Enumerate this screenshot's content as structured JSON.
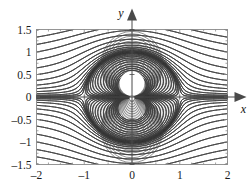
{
  "figure": {
    "kind": "contour-plot",
    "background_color": "#ffffff",
    "frame_color": "#8a8a8a",
    "contour_color": "#3a3a3a",
    "axis_color": "#4a4a4a",
    "disk_fill": "#e8e8e8",
    "disk_edge": "#cfcfcf",
    "inner_white": "#ffffff"
  },
  "axes": {
    "x_name": "x",
    "y_name": "y",
    "x_ticks": [
      "–2",
      "–1",
      "0",
      "1",
      "2"
    ],
    "x_tick_values": [
      -2,
      -1,
      0,
      1,
      2
    ],
    "y_ticks": [
      "1.5",
      "1",
      "0.5",
      "0",
      "–0.5",
      "–1",
      "–1.5"
    ],
    "y_tick_values": [
      1.5,
      1,
      0.5,
      0,
      -0.5,
      -1,
      -1.5
    ],
    "xlim": [
      -2,
      2
    ],
    "ylim": [
      -1.5,
      1.5
    ],
    "x_arrow": "arrow-right",
    "y_arrow": "arrow-up"
  },
  "chart_data": {
    "type": "line",
    "title": "",
    "xlabel": "x",
    "ylabel": "y",
    "xlim": [
      -2,
      2
    ],
    "ylim": [
      -1.5,
      1.5
    ],
    "grid": false,
    "legend": "none",
    "field": "psi(x,y) = y - y/(x^2 + y^2)",
    "singularity": {
      "x": 0,
      "y": 0
    },
    "shaded_region": {
      "shape": "disk",
      "center": [
        0,
        0
      ],
      "radius": 1,
      "fill": "#e8e8e8"
    },
    "contour_levels": [
      -1.4,
      -1.25,
      -1.1,
      -0.95,
      -0.8,
      -0.65,
      -0.5,
      -0.38,
      -0.28,
      -0.2,
      -0.14,
      -0.09,
      -0.055,
      -0.03,
      -0.015,
      -0.006,
      0.006,
      0.015,
      0.03,
      0.055,
      0.09,
      0.14,
      0.2,
      0.28,
      0.38,
      0.5,
      0.65,
      0.8,
      0.95,
      1.1,
      1.25,
      1.4
    ],
    "series": [
      {
        "name": "streamlines",
        "values": [],
        "color": "#3a3a3a"
      }
    ]
  }
}
